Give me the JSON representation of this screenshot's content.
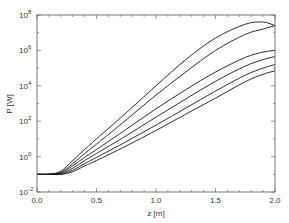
{
  "chart_data": {
    "type": "line",
    "title": "",
    "xlabel": "z [m]",
    "ylabel": "P [W]",
    "xlim": [
      0.0,
      2.0
    ],
    "ylim": [
      0.01,
      100000000
    ],
    "yscale": "log",
    "grid": false,
    "legend": null,
    "x_ticks": [
      "0.0",
      "0.5",
      "1.0",
      "1.5",
      "2.0"
    ],
    "y_ticks": [
      {
        "base": "10",
        "exp": "-2"
      },
      {
        "base": "10",
        "exp": "0"
      },
      {
        "base": "10",
        "exp": "2"
      },
      {
        "base": "10",
        "exp": "4"
      },
      {
        "base": "10",
        "exp": "6"
      },
      {
        "base": "10",
        "exp": "8"
      }
    ],
    "x": [
      0.0,
      0.1,
      0.2,
      0.3,
      0.4,
      0.5,
      0.75,
      1.0,
      1.25,
      1.5,
      1.75,
      1.9,
      2.0
    ],
    "series": [
      {
        "name": "curve 1",
        "values": [
          0.1,
          0.1,
          0.15,
          0.6,
          2.5,
          10,
          300,
          10000,
          300000,
          5000000,
          30000000,
          40000000,
          25000000
        ]
      },
      {
        "name": "curve 2",
        "values": [
          0.1,
          0.1,
          0.13,
          0.4,
          1.5,
          5,
          120,
          3000,
          60000,
          1000000,
          8000000,
          16000000,
          25000000
        ]
      },
      {
        "name": "curve 3",
        "values": [
          0.1,
          0.1,
          0.12,
          0.3,
          0.9,
          2.5,
          35,
          500,
          6000,
          60000,
          400000,
          800000,
          1000000
        ]
      },
      {
        "name": "curve 4",
        "values": [
          0.1,
          0.1,
          0.11,
          0.22,
          0.6,
          1.5,
          15,
          170,
          1800,
          18000,
          130000,
          300000,
          450000
        ]
      },
      {
        "name": "curve 5",
        "values": [
          0.1,
          0.1,
          0.1,
          0.17,
          0.4,
          0.9,
          7,
          60,
          550,
          5000,
          40000,
          100000,
          160000
        ]
      },
      {
        "name": "curve 6",
        "values": [
          0.1,
          0.1,
          0.1,
          0.14,
          0.3,
          0.6,
          4,
          30,
          250,
          2000,
          17000,
          45000,
          70000
        ]
      }
    ]
  },
  "colors": {
    "line": "#1a1a1a",
    "axis": "#555555",
    "background": "#ffffff"
  }
}
